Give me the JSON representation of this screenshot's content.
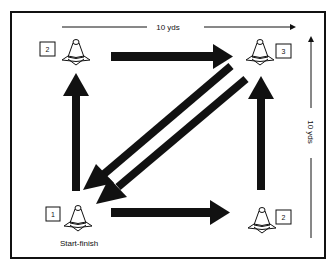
{
  "diagram": {
    "type": "drill-layout",
    "dimensions": {
      "top": "10 yds",
      "right": "10 yds"
    },
    "cones": [
      {
        "id": "cone-top-left",
        "label": "2",
        "position": "top-left"
      },
      {
        "id": "cone-top-right",
        "label": "3",
        "position": "top-right"
      },
      {
        "id": "cone-bottom-left",
        "label": "1",
        "position": "bottom-left",
        "caption": "Start-finish"
      },
      {
        "id": "cone-bottom-right",
        "label": "2",
        "position": "bottom-right"
      }
    ],
    "arrows": [
      {
        "from": "bottom-left",
        "to": "top-left",
        "direction": "up"
      },
      {
        "from": "top-left",
        "to": "top-right",
        "direction": "right"
      },
      {
        "from": "top-right",
        "to": "bottom-left",
        "direction": "diagonal-down-left"
      },
      {
        "from": "top-right",
        "to": "bottom-left",
        "direction": "diagonal-down-left"
      },
      {
        "from": "bottom-left",
        "to": "bottom-right",
        "direction": "right"
      },
      {
        "from": "bottom-right",
        "to": "top-right",
        "direction": "up"
      }
    ],
    "colors": {
      "ink": "#111111",
      "background": "#ffffff"
    }
  }
}
